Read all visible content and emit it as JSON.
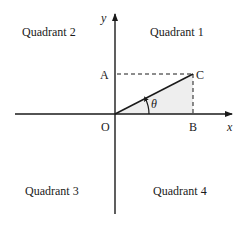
{
  "diagram": {
    "quadrants": {
      "q1": "Quadrant 1",
      "q2": "Quadrant 2",
      "q3": "Quadrant 3",
      "q4": "Quadrant 4"
    },
    "axes": {
      "x_label": "x",
      "y_label": "y"
    },
    "points": {
      "origin": "O",
      "a": "A",
      "b": "B",
      "c": "C"
    },
    "angle_label": "θ",
    "colors": {
      "line": "#1a1a1a",
      "shade": "#eeeeee",
      "background": "#ffffff"
    }
  }
}
